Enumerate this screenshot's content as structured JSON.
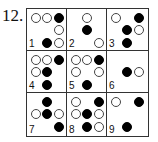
{
  "problem": {
    "number": "12."
  },
  "puzzle": {
    "rows": 3,
    "cols": 3,
    "legend": {
      "O": "white-circle",
      "X": "black-circle",
      "_": "empty"
    },
    "cells": [
      {
        "label": "1",
        "pattern": [
          [
            "O",
            "O",
            "X"
          ],
          [
            "_",
            "_",
            "O"
          ],
          [
            "L",
            "X",
            "O"
          ]
        ]
      },
      {
        "label": "2",
        "pattern": [
          [
            "_",
            "O",
            "_"
          ],
          [
            "_",
            "X",
            "_"
          ],
          [
            "L",
            "_",
            "O"
          ]
        ]
      },
      {
        "label": "3",
        "pattern": [
          [
            "O",
            "_",
            "X"
          ],
          [
            "_",
            "X",
            "O"
          ],
          [
            "L",
            "X",
            "_"
          ]
        ]
      },
      {
        "label": "4",
        "pattern": [
          [
            "O",
            "O",
            "X"
          ],
          [
            "O",
            "X",
            "_"
          ],
          [
            "L",
            "X",
            "_"
          ]
        ]
      },
      {
        "label": "5",
        "pattern": [
          [
            "O",
            "O",
            "X"
          ],
          [
            "O",
            "_",
            "O"
          ],
          [
            "L",
            "X",
            "_"
          ]
        ]
      },
      {
        "label": "6",
        "pattern": [
          [
            "_",
            "_",
            "_"
          ],
          [
            "_",
            "X",
            "O"
          ],
          [
            "L",
            "_",
            "_"
          ]
        ]
      },
      {
        "label": "7",
        "pattern": [
          [
            "_",
            "X",
            "_"
          ],
          [
            "O",
            "X",
            "O"
          ],
          [
            "L",
            "_",
            "X"
          ]
        ]
      },
      {
        "label": "8",
        "pattern": [
          [
            "O",
            "_",
            "X"
          ],
          [
            "O",
            "X",
            "O"
          ],
          [
            "L",
            "X",
            "O"
          ]
        ]
      },
      {
        "label": "9",
        "pattern": [
          [
            "O",
            "_",
            "X"
          ],
          [
            "_",
            "_",
            "_"
          ],
          [
            "L",
            "X",
            "_"
          ]
        ]
      }
    ]
  },
  "colors": {
    "filled": "#000000",
    "empty_fill": "#ffffff",
    "grid_line": "#333333"
  }
}
